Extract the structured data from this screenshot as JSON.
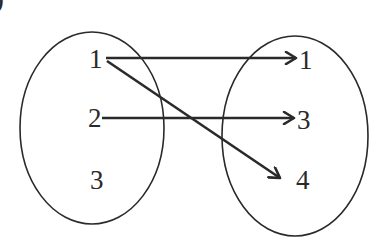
{
  "diagram": {
    "type": "mapping",
    "corner_glyph": ")",
    "domain_set": {
      "label": "domain",
      "elements": [
        "1",
        "2",
        "3"
      ]
    },
    "codomain_set": {
      "label": "codomain",
      "elements": [
        "1",
        "3",
        "4"
      ]
    },
    "mappings": [
      {
        "from": "1",
        "to": "1"
      },
      {
        "from": "2",
        "to": "3"
      },
      {
        "from": "1",
        "to": "4"
      }
    ],
    "colors": {
      "stroke": "#2a2a2a",
      "background": "#ffffff"
    }
  }
}
